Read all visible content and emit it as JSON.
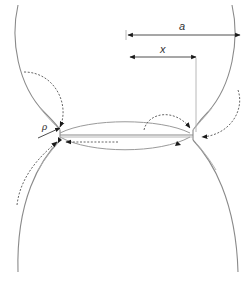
{
  "diagram": {
    "labels": {
      "neck_radius_outer": "a",
      "neck_radius_inner": "x",
      "curvature_radius": "ρ"
    },
    "elements": [
      "upper-particle-outline",
      "lower-particle-outline",
      "neck-region",
      "grain-boundary",
      "dimension-arrow-a",
      "dimension-arrow-x",
      "neck-curvature-radius-arrow",
      "dashed-diffusion-paths"
    ],
    "colors": {
      "outline": "#8a8a8a",
      "dimension": "#3a3a3a",
      "dashed": "#666666",
      "arrowhead": "#1a1a1a",
      "background": "#ffffff"
    }
  }
}
